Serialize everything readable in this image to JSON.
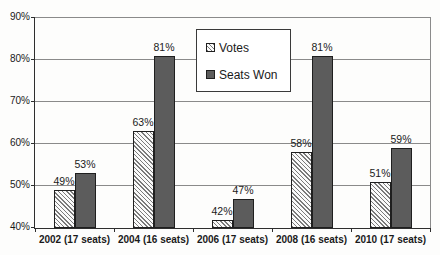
{
  "chart_data": {
    "type": "bar",
    "title": "",
    "categories": [
      "2002 (17 seats)",
      "2004 (16 seats)",
      "2006 (17 seats)",
      "2008 (16 seats)",
      "2010 (17 seats)"
    ],
    "series": [
      {
        "name": "Votes",
        "pattern": "hatched",
        "values": [
          49,
          63,
          42,
          58,
          51
        ]
      },
      {
        "name": "Seats Won",
        "pattern": "solid",
        "values": [
          53,
          81,
          47,
          81,
          59
        ]
      }
    ],
    "value_labels": [
      [
        "49%",
        "63%",
        "42%",
        "58%",
        "51%"
      ],
      [
        "53%",
        "81%",
        "47%",
        "81%",
        "59%"
      ]
    ],
    "y_axis": {
      "tick_labels": [
        "40%",
        "50%",
        "60%",
        "70%",
        "80%",
        "90%"
      ],
      "min": 40,
      "max": 90,
      "grid": true
    },
    "legend_position": "inside-top-center"
  },
  "colors": {
    "background": "#fdfdfc",
    "text": "#1a1a1a",
    "axis": "#2e2e2e",
    "gridline": "#8a8a8a",
    "bar_border": "#1f1f1f",
    "seats_won_fill": "#5c5c5c",
    "hatch_line": "#7a7a7a",
    "hatch_bg": "#fafafa",
    "legend_border": "#3a3a3a"
  }
}
